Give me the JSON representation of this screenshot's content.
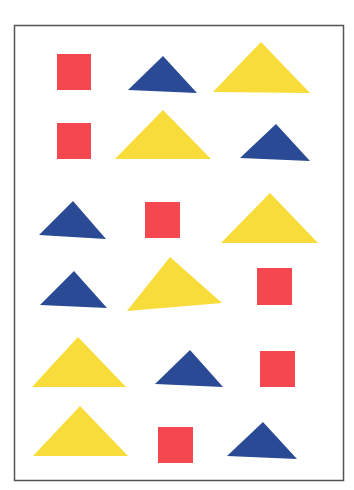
{
  "colors": {
    "red": "#F5474F",
    "blue": "#2A4A96",
    "yellow": "#F7DC3A",
    "frame": "#555555",
    "background": "#FFFFFF"
  },
  "grid": {
    "rows": 6,
    "columns": 3,
    "cells": [
      [
        {
          "shape": "square",
          "color": "red"
        },
        {
          "shape": "triangle",
          "color": "blue",
          "size": "small"
        },
        {
          "shape": "triangle",
          "color": "yellow",
          "size": "large"
        }
      ],
      [
        {
          "shape": "square",
          "color": "red"
        },
        {
          "shape": "triangle",
          "color": "yellow",
          "size": "large"
        },
        {
          "shape": "triangle",
          "color": "blue",
          "size": "small"
        }
      ],
      [
        {
          "shape": "triangle",
          "color": "blue",
          "size": "small"
        },
        {
          "shape": "square",
          "color": "red"
        },
        {
          "shape": "triangle",
          "color": "yellow",
          "size": "large"
        }
      ],
      [
        {
          "shape": "triangle",
          "color": "blue",
          "size": "small"
        },
        {
          "shape": "triangle",
          "color": "yellow",
          "size": "large"
        },
        {
          "shape": "square",
          "color": "red"
        }
      ],
      [
        {
          "shape": "triangle",
          "color": "yellow",
          "size": "large"
        },
        {
          "shape": "triangle",
          "color": "blue",
          "size": "small"
        },
        {
          "shape": "square",
          "color": "red"
        }
      ],
      [
        {
          "shape": "triangle",
          "color": "yellow",
          "size": "large"
        },
        {
          "shape": "square",
          "color": "red"
        },
        {
          "shape": "triangle",
          "color": "blue",
          "size": "small"
        }
      ]
    ]
  }
}
